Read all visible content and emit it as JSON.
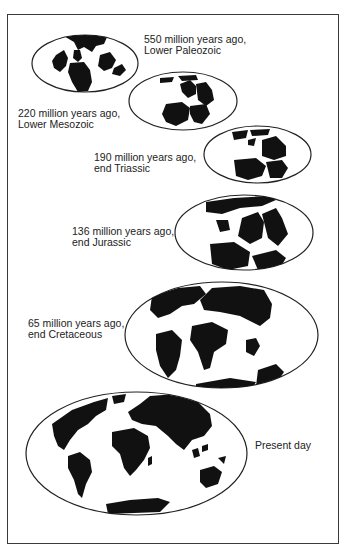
{
  "diagram": {
    "type": "continental-drift-sequence",
    "colors": {
      "land": "#111111",
      "ocean": "#ffffff",
      "outline": "#222222",
      "frame": "#3a3a3a",
      "text": "#222222"
    },
    "stages": [
      {
        "id": "s1",
        "age": "550 million years ago,",
        "period": "Lower Paleozoic"
      },
      {
        "id": "s2",
        "age": "220 million years ago,",
        "period": "Lower Mesozoic"
      },
      {
        "id": "s3",
        "age": "190 million years ago,",
        "period": "end Triassic"
      },
      {
        "id": "s4",
        "age": "136 million years ago,",
        "period": "end Jurassic"
      },
      {
        "id": "s5",
        "age": "65 million years ago,",
        "period": "end Cretaceous"
      },
      {
        "id": "s6",
        "age": "Present day",
        "period": ""
      }
    ]
  }
}
